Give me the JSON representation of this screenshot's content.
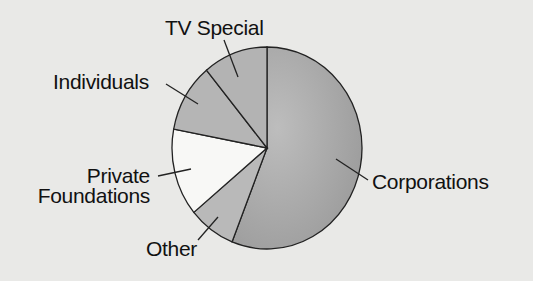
{
  "chart_data": {
    "type": "pie",
    "title": "",
    "start_angle_deg": 0,
    "direction": "clockwise",
    "categories": [
      "Corporations",
      "Other",
      "Private Foundations",
      "Individuals",
      "TV Special"
    ],
    "values": [
      56,
      8,
      14,
      11,
      11
    ],
    "unit": "percent (estimated from slice angles)",
    "colors": [
      "#a6a6a6",
      "#b9b9b9",
      "#f8f8f6",
      "#b5b5b5",
      "#b3b3b3"
    ],
    "legend": "none (direct labels with leader lines)"
  },
  "labels": {
    "corporations": "Corporations",
    "other": "Other",
    "private_line1": "Private",
    "private_line2": "Foundations",
    "individuals": "Individuals",
    "tv_special": "TV Special"
  }
}
